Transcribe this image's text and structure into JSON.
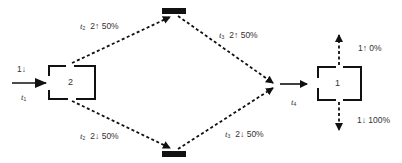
{
  "diagram": {
    "nodes": [
      {
        "id": "box-2",
        "label": "2"
      },
      {
        "id": "box-1",
        "label": "1"
      },
      {
        "id": "bar-top",
        "label": ""
      },
      {
        "id": "bar-bottom",
        "label": ""
      }
    ],
    "input": {
      "state": "1↓",
      "time_var": "t",
      "time_sub": "1"
    },
    "upper_branch": {
      "first_leg": {
        "time_var": "t",
        "time_sub": "2",
        "state": "2↑",
        "prob": "50%"
      },
      "second_leg": {
        "time_var": "t",
        "time_sub": "3",
        "state": "2↑",
        "prob": "50%"
      }
    },
    "lower_branch": {
      "first_leg": {
        "time_var": "t",
        "time_sub": "2",
        "state": "2↓",
        "prob": "50%"
      },
      "second_leg": {
        "time_var": "t",
        "time_sub": "3",
        "state": "2↓",
        "prob": "50%"
      }
    },
    "merge": {
      "time_var": "t",
      "time_sub": "4"
    },
    "outputs": {
      "up": {
        "state": "1↑",
        "prob": "0%"
      },
      "down": {
        "state": "1↓",
        "prob": "100%"
      }
    }
  },
  "colors": {
    "line": "#111111",
    "text": "#333333",
    "background": "#ffffff"
  }
}
